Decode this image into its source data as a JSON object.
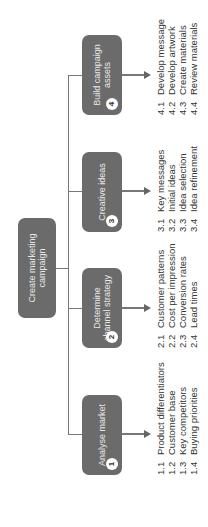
{
  "root": {
    "label": "Create marketing campaign"
  },
  "tasks": [
    {
      "number": "1",
      "label": "Analyse market",
      "items": [
        {
          "num": "1.1",
          "text": "Product differentiators"
        },
        {
          "num": "1.2",
          "text": "Customer base"
        },
        {
          "num": "1.3",
          "text": "Key competitors"
        },
        {
          "num": "1.4",
          "text": "Buying priorities"
        }
      ]
    },
    {
      "number": "2",
      "label": "Determine channel strategy",
      "items": [
        {
          "num": "2.1",
          "text": "Customer patterns"
        },
        {
          "num": "2.2",
          "text": "Cost per impression"
        },
        {
          "num": "2.3",
          "text": "Conversion rates"
        },
        {
          "num": "2.4",
          "text": "Lead times"
        }
      ]
    },
    {
      "number": "3",
      "label": "Creative ideas",
      "items": [
        {
          "num": "3.1",
          "text": "Key messages"
        },
        {
          "num": "3.2",
          "text": "Initial ideas"
        },
        {
          "num": "3.3",
          "text": "Idea selection"
        },
        {
          "num": "3.4",
          "text": "Idea refinement"
        }
      ]
    },
    {
      "number": "4",
      "label": "Build campaign assets",
      "items": [
        {
          "num": "4.1",
          "text": "Develop message"
        },
        {
          "num": "4.2",
          "text": "Develop artwork"
        },
        {
          "num": "4.3",
          "text": "Create materials"
        },
        {
          "num": "4.4",
          "text": "Review materials"
        }
      ]
    }
  ],
  "colors": {
    "box": "#6b6b6b",
    "box_text": "#e8e8e8",
    "line": "#777777",
    "text": "#333333"
  }
}
